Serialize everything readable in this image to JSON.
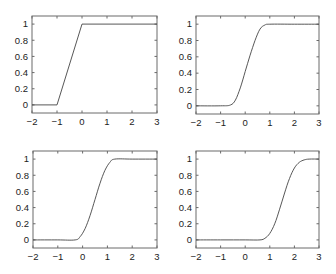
{
  "chart_data": [
    {
      "type": "line",
      "title": "",
      "xlabel": "",
      "ylabel": "",
      "xlim": [
        -2,
        3
      ],
      "ylim": [
        -0.1,
        1.1
      ],
      "xticks": [
        -2,
        -1,
        0,
        1,
        2,
        3
      ],
      "yticks": [
        0,
        0.2,
        0.4,
        0.6,
        0.8,
        1
      ],
      "grid": false,
      "series": [
        {
          "name": "ramp",
          "x": [
            -2,
            -1,
            0,
            3
          ],
          "y": [
            0,
            0,
            1,
            1
          ]
        }
      ]
    },
    {
      "type": "line",
      "title": "",
      "xlabel": "",
      "ylabel": "",
      "xlim": [
        -2,
        3
      ],
      "ylim": [
        -0.1,
        1.1
      ],
      "xticks": [
        -2,
        -1,
        0,
        1,
        2,
        3
      ],
      "yticks": [
        0,
        0.2,
        0.4,
        0.6,
        0.8,
        1
      ],
      "grid": false,
      "series": [
        {
          "name": "smoothed-1",
          "x": [
            -2,
            -1,
            -0.6,
            -0.4,
            -0.2,
            0,
            0.2,
            0.4,
            0.6,
            0.8,
            1,
            2,
            3
          ],
          "y": [
            0,
            0,
            0.01,
            0.07,
            0.22,
            0.42,
            0.62,
            0.8,
            0.94,
            0.99,
            1,
            1,
            1
          ]
        }
      ]
    },
    {
      "type": "line",
      "title": "",
      "xlabel": "",
      "ylabel": "",
      "xlim": [
        -2,
        3
      ],
      "ylim": [
        -0.1,
        1.1
      ],
      "xticks": [
        -2,
        -1,
        0,
        1,
        2,
        3
      ],
      "yticks": [
        0,
        0.2,
        0.4,
        0.6,
        0.8,
        1
      ],
      "grid": false,
      "series": [
        {
          "name": "smoothed-2",
          "x": [
            -2,
            -1,
            -0.3,
            -0.1,
            0.1,
            0.3,
            0.5,
            0.7,
            0.9,
            1.1,
            1.3,
            2,
            3
          ],
          "y": [
            0,
            0,
            0.0,
            0.04,
            0.14,
            0.3,
            0.5,
            0.7,
            0.86,
            0.96,
            1,
            1,
            1
          ]
        }
      ]
    },
    {
      "type": "line",
      "title": "",
      "xlabel": "",
      "ylabel": "",
      "xlim": [
        -2,
        3
      ],
      "ylim": [
        -0.1,
        1.1
      ],
      "xticks": [
        -2,
        -1,
        0,
        1,
        2,
        3
      ],
      "yticks": [
        0,
        0.2,
        0.4,
        0.6,
        0.8,
        1
      ],
      "grid": false,
      "series": [
        {
          "name": "smoothed-3",
          "x": [
            -2,
            -1,
            0,
            0.6,
            0.8,
            1.0,
            1.2,
            1.4,
            1.6,
            1.8,
            2.0,
            2.2,
            2.4,
            2.6,
            3
          ],
          "y": [
            0,
            0,
            0,
            0,
            0.02,
            0.08,
            0.2,
            0.38,
            0.58,
            0.76,
            0.89,
            0.96,
            0.99,
            1,
            1
          ]
        }
      ]
    }
  ],
  "panels": [
    {
      "box": {
        "left": 32,
        "top": 16,
        "right": 157,
        "bottom": 113
      }
    },
    {
      "box": {
        "left": 196,
        "top": 16,
        "right": 319,
        "bottom": 114
      }
    },
    {
      "box": {
        "left": 33,
        "top": 151,
        "right": 157,
        "bottom": 248
      }
    },
    {
      "box": {
        "left": 196,
        "top": 151,
        "right": 319,
        "bottom": 248
      }
    }
  ],
  "style": {
    "axis_color": "#6a6a6a",
    "line_color": "#444444",
    "text_color": "#222222"
  }
}
